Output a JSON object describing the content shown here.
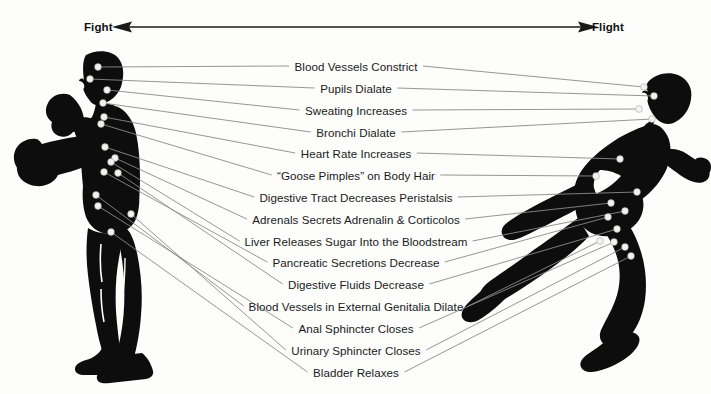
{
  "diagram": {
    "title_left": "Fight",
    "title_right": "Flight",
    "axis": {
      "name": "fight-flight-axis",
      "left_arrow": "arrow-left",
      "right_arrow": "arrow-right"
    },
    "figures": [
      {
        "name": "fight-figure",
        "description": "boxer silhouette",
        "side": "left"
      },
      {
        "name": "flight-figure",
        "description": "running silhouette",
        "side": "right"
      }
    ],
    "effects": [
      {
        "label": "Blood Vessels Constrict",
        "y": 66,
        "cx": 356,
        "left_anchor": [
          98,
          67
        ],
        "right_anchor": [
          644,
          87
        ]
      },
      {
        "label": "Pupils Dialate",
        "y": 88,
        "cx": 356,
        "left_anchor": [
          90,
          79
        ],
        "right_anchor": [
          654,
          96
        ]
      },
      {
        "label": "Sweating Increases",
        "y": 110,
        "cx": 356,
        "left_anchor": [
          107,
          90
        ],
        "right_anchor": [
          639,
          109
        ]
      },
      {
        "label": "Bronchi Dialate",
        "y": 132,
        "cx": 356,
        "left_anchor": [
          103,
          103
        ],
        "right_anchor": [
          652,
          119
        ]
      },
      {
        "label": "Heart Rate Increases",
        "y": 153,
        "cx": 356,
        "left_anchor": [
          104,
          117
        ],
        "right_anchor": [
          620,
          159
        ]
      },
      {
        "label": "“Goose Pimples” on Body Hair",
        "y": 175,
        "cx": 356,
        "left_anchor": [
          101,
          124
        ],
        "right_anchor": [
          596,
          176
        ]
      },
      {
        "label": "Digestive Tract Decreases Peristalsis",
        "y": 197,
        "cx": 356,
        "left_anchor": [
          105,
          147
        ],
        "right_anchor": [
          637,
          192
        ]
      },
      {
        "label": "Adrenals Secrets Adrenalin & Corticolos",
        "y": 219,
        "cx": 356,
        "left_anchor": [
          115,
          158
        ],
        "right_anchor": [
          611,
          203
        ]
      },
      {
        "label": "Liver Releases Sugar Into the Bloodstream",
        "y": 241,
        "cx": 356,
        "left_anchor": [
          111,
          162
        ],
        "right_anchor": [
          625,
          211
        ]
      },
      {
        "label": "Pancreatic Secretions Decrease",
        "y": 262,
        "cx": 356,
        "left_anchor": [
          104,
          172
        ],
        "right_anchor": [
          608,
          217
        ]
      },
      {
        "label": "Digestive Fluids Decrease",
        "y": 284,
        "cx": 356,
        "left_anchor": [
          118,
          173
        ],
        "right_anchor": [
          617,
          229
        ]
      },
      {
        "label": "Blood Vessels in External Genitalia Dilate",
        "y": 306,
        "cx": 356,
        "left_anchor": [
          96,
          195
        ],
        "right_anchor": [
          600,
          241
        ]
      },
      {
        "label": "Anal Sphincter Closes",
        "y": 328,
        "cx": 356,
        "left_anchor": [
          98,
          206
        ],
        "right_anchor": [
          614,
          242
        ]
      },
      {
        "label": "Urinary Sphincter Closes",
        "y": 350,
        "cx": 356,
        "left_anchor": [
          131,
          214
        ],
        "right_anchor": [
          625,
          247
        ]
      },
      {
        "label": "Bladder Relaxes",
        "y": 372,
        "cx": 356,
        "left_anchor": [
          111,
          232
        ],
        "right_anchor": [
          631,
          256
        ]
      }
    ],
    "colors": {
      "silhouette": "#0d0d0d",
      "leader_line": "#8a8a8a",
      "text": "#1a1a1a",
      "background": "#fdfdfc",
      "marker": "#f2f2f0"
    }
  }
}
